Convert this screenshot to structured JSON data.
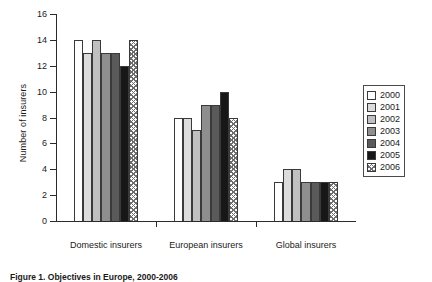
{
  "chart_data": {
    "type": "bar",
    "title": "",
    "xlabel": "",
    "ylabel": "Number of insurers",
    "ylim": [
      0,
      16
    ],
    "yticks": [
      0,
      2,
      4,
      6,
      8,
      10,
      12,
      14,
      16
    ],
    "grid": false,
    "legend_position": "right",
    "categories": [
      "Domestic insurers",
      "European insurers",
      "Global insurers"
    ],
    "series": [
      {
        "name": "2000",
        "values": [
          14,
          8,
          3
        ],
        "fill": "white",
        "color": "#ffffff"
      },
      {
        "name": "2001",
        "values": [
          13,
          8,
          4
        ],
        "fill": "light-gray",
        "color": "#dcdcdc"
      },
      {
        "name": "2002",
        "values": [
          14,
          7,
          4
        ],
        "fill": "gray",
        "color": "#c0c0c0"
      },
      {
        "name": "2003",
        "values": [
          13,
          9,
          3
        ],
        "fill": "medium-gray",
        "color": "#8e8e8e"
      },
      {
        "name": "2004",
        "values": [
          13,
          9,
          3
        ],
        "fill": "dark-gray",
        "color": "#5a5a5a"
      },
      {
        "name": "2005",
        "values": [
          12,
          10,
          3
        ],
        "fill": "black",
        "color": "#171717"
      },
      {
        "name": "2006",
        "values": [
          14,
          8,
          3
        ],
        "fill": "cross-hatch",
        "color": "#6e6e6e"
      }
    ]
  },
  "legend": {
    "entries": [
      "2000",
      "2001",
      "2002",
      "2003",
      "2004",
      "2005",
      "2006"
    ]
  },
  "caption": {
    "text": "Figure 1. Objectives in Europe, 2000-2006"
  }
}
